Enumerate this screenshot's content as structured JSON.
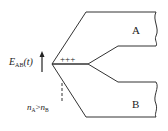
{
  "diagram": {
    "regions": [
      {
        "id": "A",
        "label": "A"
      },
      {
        "id": "B",
        "label": "B"
      }
    ],
    "field_label": {
      "symbol": "E",
      "subscript": "AB",
      "arg": "(t)"
    },
    "charge_label": "+++",
    "condition_label": {
      "left": "n",
      "left_sub": "A",
      "op": ">",
      "right": "n",
      "right_sub": "B"
    },
    "colors": {
      "stroke": "#333333",
      "text": "#222222",
      "background": "#ffffff"
    }
  }
}
